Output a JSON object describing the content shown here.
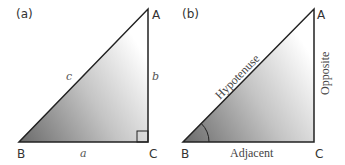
{
  "panels": [
    {
      "label": "(a)",
      "vertices": {
        "A": "A",
        "B": "B",
        "C": "C"
      },
      "sides": {
        "a": "a",
        "b": "b",
        "c": "c"
      },
      "right_angle_at": "C"
    },
    {
      "label": "(b)",
      "vertices": {
        "A": "A",
        "B": "B",
        "C": "C"
      },
      "sides": {
        "hypotenuse": "Hypotenuse",
        "opposite": "Opposite",
        "adjacent": "Adjacent"
      },
      "angle_marked_at": "B"
    }
  ],
  "colors": {
    "stroke": "#222222",
    "gradient_dark": "#6e6e6e",
    "gradient_light": "#ffffff"
  }
}
